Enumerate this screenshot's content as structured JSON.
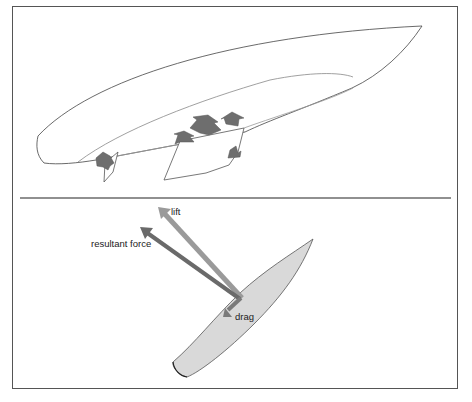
{
  "diagram": {
    "top_panel": {
      "description": "Perspective view of sailboard hull with fin showing pressure arrows",
      "arrows_count": 6,
      "arrow_color": "#6e6e6e"
    },
    "bottom_panel": {
      "description": "Top view of board with force vectors",
      "labels": {
        "lift": "lift",
        "resultant": "resultant force",
        "drag": "drag"
      },
      "colors": {
        "board_fill": "#d9d9d9",
        "lift_arrow": "#9a9a9a",
        "resultant_arrow": "#6a6a6a",
        "drag_arrow": "#7a7a7a",
        "frame": "#555555"
      }
    }
  }
}
